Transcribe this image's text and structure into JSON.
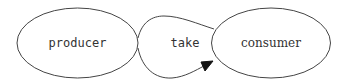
{
  "diagram": {
    "type": "flow",
    "nodes": [
      {
        "id": "producer",
        "label": "producer",
        "shape": "ellipse",
        "font": "monospace"
      },
      {
        "id": "consumer",
        "label": "consumer",
        "shape": "ellipse",
        "font": "serif"
      }
    ],
    "edges": [
      {
        "from": "producer",
        "to": "consumer",
        "label": "take",
        "arrow": "filled"
      }
    ],
    "colors": {
      "stroke": "#444444",
      "arrow": "#111111",
      "text": "#333333",
      "background": "#ffffff"
    }
  }
}
